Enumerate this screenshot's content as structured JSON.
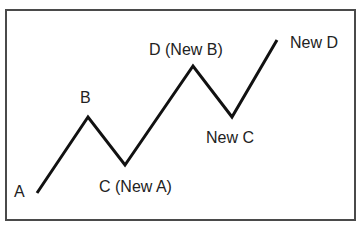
{
  "diagram": {
    "type": "zigzag-wave",
    "line_color": "#111111",
    "border_color": "#4a4a4a",
    "points": [
      {
        "id": "A",
        "label": "A",
        "x": 37,
        "y": 193
      },
      {
        "id": "B",
        "label": "B",
        "x": 88,
        "y": 117
      },
      {
        "id": "C",
        "label": "C (New A)",
        "x": 125,
        "y": 165
      },
      {
        "id": "D",
        "label": "D (New B)",
        "x": 193,
        "y": 66
      },
      {
        "id": "NewC",
        "label": "New C",
        "x": 232,
        "y": 117
      },
      {
        "id": "NewD",
        "label": "New D",
        "x": 277,
        "y": 40
      }
    ],
    "polyline": "37,193 88,117 125,165 193,66 232,117 277,40"
  }
}
